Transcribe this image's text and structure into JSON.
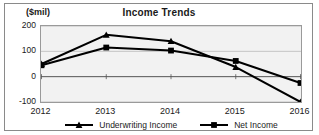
{
  "chart_data": {
    "type": "line",
    "title": "Income Trends",
    "ylabel": "($mil)",
    "xlabel": "",
    "categories": [
      "2012",
      "2013",
      "2014",
      "2015",
      "2016"
    ],
    "ylim": [
      -100,
      200
    ],
    "yticks": [
      200,
      100,
      0,
      -100
    ],
    "ytick_labels": [
      "200",
      "100",
      "0",
      "-100"
    ],
    "grid": true,
    "legend_position": "bottom",
    "series": [
      {
        "name": "Underwriting Income",
        "marker": "triangle",
        "color": "#000000",
        "values": [
          50,
          165,
          140,
          38,
          -100
        ]
      },
      {
        "name": "Net Income",
        "marker": "square",
        "color": "#000000",
        "values": [
          45,
          115,
          103,
          62,
          -25
        ]
      }
    ]
  },
  "legend": {
    "items": [
      {
        "label": "Underwriting Income",
        "marker": "triangle-marker-icon"
      },
      {
        "label": "Net Income",
        "marker": "square-marker-icon"
      }
    ]
  },
  "colors": {
    "plot_background": "#f2f2f2",
    "frame_border": "#8a8a8a",
    "axis": "#555555",
    "gridline": "#b8b8b8",
    "series": "#000000",
    "text": "#1a1a1a"
  }
}
